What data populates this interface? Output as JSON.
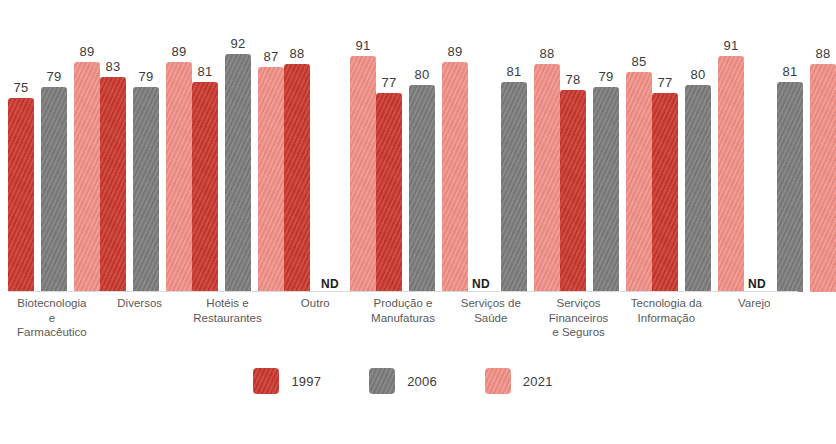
{
  "chart_data": {
    "type": "bar",
    "title": "",
    "subtitle": "",
    "xlabel": "",
    "ylabel": "",
    "ylim": [
      0,
      100
    ],
    "grid": false,
    "legend_position": "bottom-center",
    "nd_label": "ND",
    "nd_meaning": "Não Disponível",
    "categories": [
      "Biotecnologia\ne\nFarmacêutico",
      "Diversos",
      "Hotéis e\nRestaurantes",
      "Outro",
      "Produção e\nManufaturas",
      "Serviços de\nSaúde",
      "Serviços\nFinanceiros\ne Seguros",
      "Tecnologia da\nInformação",
      "Varejo"
    ],
    "series": [
      {
        "name": "1997",
        "color": "#c8382f",
        "values": [
          75,
          83,
          81,
          88,
          77,
          null,
          78,
          77,
          null
        ]
      },
      {
        "name": "2006",
        "color": "#7b7b7b",
        "values": [
          79,
          79,
          92,
          null,
          80,
          81,
          79,
          80,
          81
        ]
      },
      {
        "name": "2021",
        "color": "#ef8d84",
        "values": [
          89,
          89,
          87,
          91,
          89,
          88,
          85,
          91,
          88
        ]
      }
    ]
  },
  "legend": {
    "items": [
      {
        "label": "1997",
        "color": "#c8382f"
      },
      {
        "label": "2006",
        "color": "#7b7b7b"
      },
      {
        "label": "2021",
        "color": "#ef8d84"
      }
    ]
  }
}
